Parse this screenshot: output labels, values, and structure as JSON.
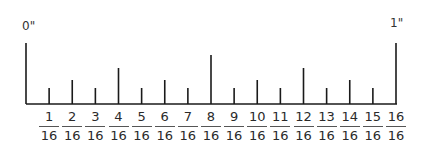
{
  "diagram": {
    "start_label": "0\"",
    "end_label": "1\"",
    "ticks": [
      {
        "index": 0,
        "kind": "inch"
      },
      {
        "index": 1,
        "kind": "sixteenth"
      },
      {
        "index": 2,
        "kind": "eighth"
      },
      {
        "index": 3,
        "kind": "sixteenth"
      },
      {
        "index": 4,
        "kind": "quarter"
      },
      {
        "index": 5,
        "kind": "sixteenth"
      },
      {
        "index": 6,
        "kind": "eighth"
      },
      {
        "index": 7,
        "kind": "sixteenth"
      },
      {
        "index": 8,
        "kind": "half"
      },
      {
        "index": 9,
        "kind": "sixteenth"
      },
      {
        "index": 10,
        "kind": "eighth"
      },
      {
        "index": 11,
        "kind": "sixteenth"
      },
      {
        "index": 12,
        "kind": "quarter"
      },
      {
        "index": 13,
        "kind": "sixteenth"
      },
      {
        "index": 14,
        "kind": "eighth"
      },
      {
        "index": 15,
        "kind": "sixteenth"
      },
      {
        "index": 16,
        "kind": "inch"
      }
    ],
    "labels": [
      {
        "num": "1",
        "den": "16"
      },
      {
        "num": "2",
        "den": "16"
      },
      {
        "num": "3",
        "den": "16"
      },
      {
        "num": "4",
        "den": "16"
      },
      {
        "num": "5",
        "den": "16"
      },
      {
        "num": "6",
        "den": "16"
      },
      {
        "num": "7",
        "den": "16"
      },
      {
        "num": "8",
        "den": "16"
      },
      {
        "num": "9",
        "den": "16"
      },
      {
        "num": "10",
        "den": "16"
      },
      {
        "num": "11",
        "den": "16"
      },
      {
        "num": "12",
        "den": "16"
      },
      {
        "num": "13",
        "den": "16"
      },
      {
        "num": "14",
        "den": "16"
      },
      {
        "num": "15",
        "den": "16"
      },
      {
        "num": "16",
        "den": "16"
      }
    ],
    "colors": {
      "line": "#1a1a1a",
      "text": "#2a2a2a"
    }
  }
}
